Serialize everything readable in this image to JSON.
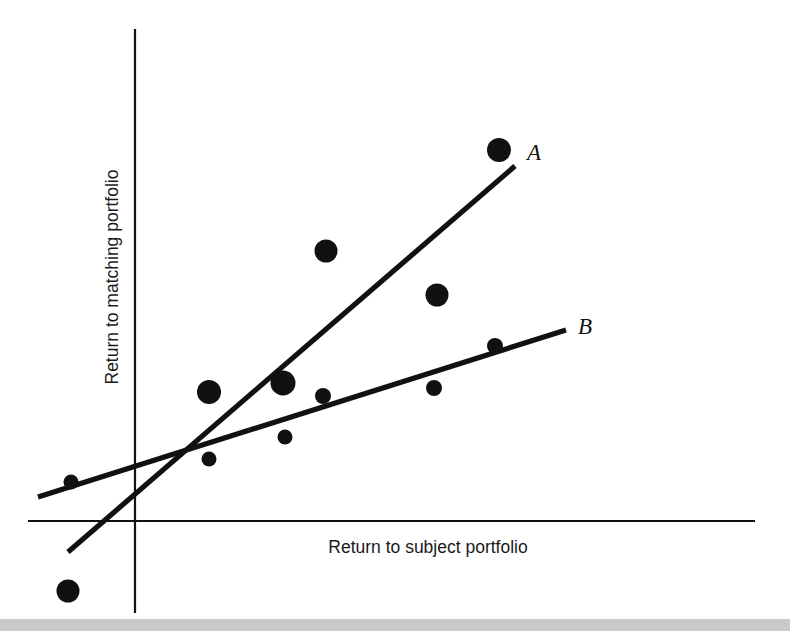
{
  "chart_data": {
    "type": "scatter",
    "title": "",
    "subtitle": "",
    "xlabel": "Return to subject portfolio",
    "ylabel": "Return to matching portfolio",
    "grid": false,
    "legend_position": "inline-line-end",
    "axes": {
      "x_axis_label": "Return to subject portfolio",
      "y_axis_label": "Return to matching portfolio",
      "x_tick_labels": [],
      "y_tick_labels": [],
      "xlim": [
        -1.45,
        6.7
      ],
      "ylim": [
        -2.2,
        7.4
      ],
      "origin_marked": true,
      "axis_color": "#111111"
    },
    "points": [
      {
        "id": "p1",
        "x": -1.2,
        "y": -1.9,
        "size": "large",
        "px": 68,
        "py": 591,
        "r": 11.5
      },
      {
        "id": "p2",
        "x": -1.18,
        "y": 0.05,
        "size": "small",
        "px": 71,
        "py": 482,
        "r": 7.5
      },
      {
        "id": "p3",
        "x": 0.8,
        "y": 0.33,
        "size": "small",
        "px": 209,
        "py": 459,
        "r": 7.5
      },
      {
        "id": "p4",
        "x": 0.82,
        "y": 1.55,
        "size": "large",
        "px": 209,
        "py": 392,
        "r": 12.0
      },
      {
        "id": "p5",
        "x": 2.02,
        "y": 0.73,
        "size": "small",
        "px": 285,
        "py": 437,
        "r": 7.5
      },
      {
        "id": "p6",
        "x": 2.05,
        "y": 1.72,
        "size": "large",
        "px": 283,
        "py": 383,
        "r": 12.5
      },
      {
        "id": "p7",
        "x": 2.72,
        "y": 1.49,
        "size": "small",
        "px": 323,
        "py": 396,
        "r": 8.0
      },
      {
        "id": "p8",
        "x": 2.76,
        "y": 4.12,
        "size": "large",
        "px": 326,
        "py": 251,
        "r": 11.5
      },
      {
        "id": "p9",
        "x": 4.55,
        "y": 1.65,
        "size": "small",
        "px": 434,
        "py": 388,
        "r": 8.0
      },
      {
        "id": "p10",
        "x": 4.58,
        "y": 3.35,
        "size": "large",
        "px": 437,
        "py": 295,
        "r": 11.5
      },
      {
        "id": "p11",
        "x": 5.62,
        "y": 2.4,
        "size": "small",
        "px": 495,
        "py": 346,
        "r": 8.0
      },
      {
        "id": "p12",
        "x": 5.68,
        "y": 5.95,
        "size": "large",
        "px": 499,
        "py": 150,
        "r": 12.0
      }
    ],
    "fit_lines": [
      {
        "name": "A",
        "label": "A",
        "description": "steep regression line",
        "slope_relative": "steep",
        "px_start": 68,
        "py_start": 552,
        "px_end": 515,
        "py_end": 166
      },
      {
        "name": "B",
        "label": "B",
        "description": "shallow regression line",
        "slope_relative": "shallow",
        "px_start": 38,
        "py_start": 497,
        "px_end": 566,
        "py_end": 330
      }
    ],
    "series_labels": [
      {
        "text": "A",
        "px": 527,
        "py": 160
      },
      {
        "text": "B",
        "px": 578,
        "py": 334
      }
    ],
    "colors": {
      "marker": "#111111",
      "line": "#111111",
      "axis": "#111111",
      "background": "#ffffff",
      "bottom_band": "#c9c9c9"
    }
  },
  "figure": {
    "x_axis_title": "Return to subject portfolio",
    "y_axis_title": "Return to matching portfolio",
    "label_a": "A",
    "label_b": "B"
  }
}
